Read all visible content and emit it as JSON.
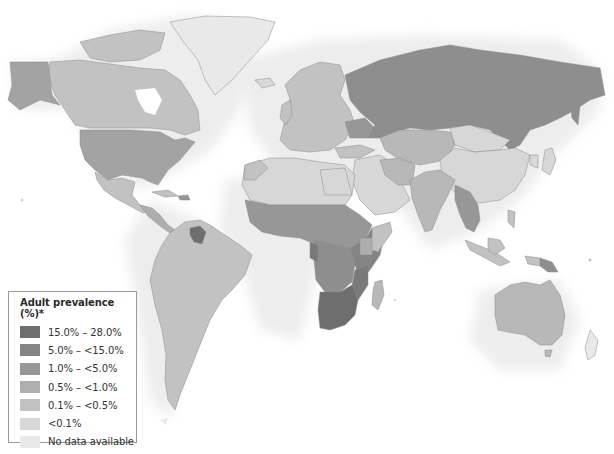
{
  "map": {
    "type": "choropleth",
    "subject": "Adult HIV prevalence by country",
    "projection": "world"
  },
  "legend": {
    "title": "Adult prevalence (%)*",
    "items": [
      {
        "label": "15.0% – 28.0%",
        "color": "#6e6e6e"
      },
      {
        "label": "5.0% – <15.0%",
        "color": "#848484"
      },
      {
        "label": "1.0% – <5.0%",
        "color": "#979797"
      },
      {
        "label": "0.5% – <1.0%",
        "color": "#aeaeae"
      },
      {
        "label": "0.1% – <0.5%",
        "color": "#c2c2c2"
      },
      {
        "label": "<0.1%",
        "color": "#d7d7d7"
      },
      {
        "label": "No data available",
        "color": "#e9e9e9"
      }
    ]
  },
  "regions": [
    {
      "name": "Greenland",
      "class": "No data available"
    },
    {
      "name": "Canada",
      "class": "0.1% – <0.5%"
    },
    {
      "name": "Alaska/USA",
      "class": "0.5% – <1.0%"
    },
    {
      "name": "Mexico",
      "class": "0.1% – <0.5%"
    },
    {
      "name": "Central America",
      "class": "0.5% – <1.0%"
    },
    {
      "name": "Guyana/Suriname",
      "class": "1.0% – <5.0%"
    },
    {
      "name": "South America",
      "class": "0.1% – <0.5%"
    },
    {
      "name": "Russia",
      "class": "1.0% – <5.0%"
    },
    {
      "name": "Ukraine",
      "class": "1.0% – <5.0%"
    },
    {
      "name": "Europe",
      "class": "0.1% – <0.5%"
    },
    {
      "name": "North Africa",
      "class": "<0.1%"
    },
    {
      "name": "West/Central Africa",
      "class": "1.0% – <5.0%"
    },
    {
      "name": "East Africa",
      "class": "5.0% – <15.0%"
    },
    {
      "name": "Southern Africa",
      "class": "15.0% – 28.0%"
    },
    {
      "name": "Madagascar",
      "class": "0.1% – <0.5%"
    },
    {
      "name": "Middle East",
      "class": "<0.1%"
    },
    {
      "name": "Central Asia",
      "class": "0.1% – <0.5%"
    },
    {
      "name": "China",
      "class": "<0.1%"
    },
    {
      "name": "India",
      "class": "0.1% – <0.5%"
    },
    {
      "name": "Southeast Asia",
      "class": "1.0% – <5.0%"
    },
    {
      "name": "Indonesia",
      "class": "0.1% – <0.5%"
    },
    {
      "name": "Papua New Guinea",
      "class": "0.5% – <1.0%"
    },
    {
      "name": "Australia",
      "class": "0.1% – <0.5%"
    },
    {
      "name": "Japan",
      "class": "<0.1%"
    },
    {
      "name": "Antarctica-edge/NZ",
      "class": "No data available"
    }
  ]
}
